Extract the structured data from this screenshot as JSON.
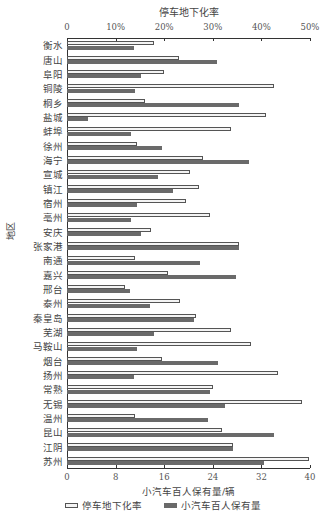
{
  "chart_data": {
    "type": "bar",
    "orientation": "horizontal",
    "title": "停车地下化率",
    "ylabel": "地区",
    "xlabel": "小汽车百人保有量/辆",
    "top_axis": {
      "label": "停车地下化率",
      "ticks": [
        "0",
        "10%",
        "20%",
        "30%",
        "40%",
        "50%"
      ],
      "range": [
        0,
        50
      ]
    },
    "bottom_axis": {
      "label": "小汽车百人保有量/辆",
      "ticks": [
        "0",
        "8",
        "16",
        "24",
        "32",
        "40"
      ],
      "range": [
        0,
        40
      ]
    },
    "grid": false,
    "legend_position": "bottom",
    "categories": [
      "衡水",
      "唐山",
      "阜阳",
      "铜陵",
      "桐乡",
      "盐城",
      "蚌埠",
      "徐州",
      "海宁",
      "宣城",
      "镇江",
      "宿州",
      "亳州",
      "安庆",
      "张家港",
      "南通",
      "嘉兴",
      "邢台",
      "泰州",
      "秦皇岛",
      "芜湖",
      "马鞍山",
      "烟台",
      "扬州",
      "常熟",
      "无锡",
      "温州",
      "昆山",
      "江阴",
      "苏州"
    ],
    "series": [
      {
        "name": "停车地下化率",
        "axis": "top",
        "unit": "%",
        "color": "#f4f4f4",
        "values": [
          17.9,
          23.0,
          20.0,
          42.6,
          16.0,
          40.9,
          33.8,
          14.5,
          28.0,
          25.3,
          27.2,
          24.5,
          29.4,
          17.3,
          35.4,
          13.9,
          20.7,
          12.0,
          23.2,
          26.5,
          33.8,
          37.8,
          19.5,
          43.4,
          30.0,
          48.4,
          13.9,
          31.9,
          34.2,
          49.8
        ]
      },
      {
        "name": "小汽车百人保有量",
        "axis": "bottom",
        "unit": "辆",
        "color": "#6a6a6a",
        "values": [
          11.0,
          24.7,
          12.2,
          11.2,
          28.3,
          3.5,
          10.6,
          15.7,
          30.0,
          15.0,
          17.4,
          11.5,
          10.5,
          12.2,
          28.3,
          21.9,
          27.8,
          10.4,
          13.7,
          20.9,
          14.3,
          11.5,
          24.9,
          11.0,
          23.5,
          26.0,
          23.2,
          34.1,
          27.3,
          32.4
        ]
      }
    ]
  },
  "legend": {
    "items": [
      {
        "label": "停车地下化率"
      },
      {
        "label": "小汽车百人保有量"
      }
    ]
  }
}
